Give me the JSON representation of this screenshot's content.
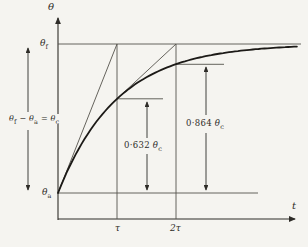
{
  "figure": {
    "bg_color": "#f5f4f0",
    "ink_color": "#2e2c28",
    "thin_line_color": "#55524c"
  },
  "axis": {
    "y_label": "θ",
    "x_label": "t"
  },
  "ticks": {
    "tau": "τ",
    "two_tau": "2τ"
  },
  "levels": {
    "final": {
      "base": "θ",
      "sub": "f"
    },
    "ambient": {
      "base": "θ",
      "sub": "a"
    }
  },
  "annotations": {
    "equation": {
      "t1": "θ",
      "s1": "f",
      "op": "−",
      "t2": "θ",
      "s2": "a",
      "eq": "=",
      "t3": "θ",
      "s3": "c"
    },
    "rise_at_tau": {
      "value": "0·632",
      "theta": "θ",
      "sub": "c"
    },
    "rise_at_two_tau": {
      "value": "0·864",
      "theta": "θ",
      "sub": "c"
    }
  },
  "chart_data": {
    "type": "line",
    "xlabel": "t",
    "ylabel": "θ",
    "x_ticks": [
      "τ",
      "2τ"
    ],
    "y_ticks": [
      "θa",
      "θf"
    ],
    "curve_equation": "θ(t) = θa + θc·(1 − e^(−t/τ)),  θc = θf − θa",
    "x_in_tau_units": [
      0,
      0.25,
      0.5,
      0.75,
      1,
      1.5,
      2,
      2.5,
      3,
      3.5,
      4
    ],
    "rise_fraction_of_theta_c": [
      0,
      0.221,
      0.393,
      0.528,
      0.632,
      0.777,
      0.864,
      0.918,
      0.95,
      0.97,
      0.982
    ],
    "key_points": [
      {
        "t": "τ",
        "rise": "0.632 θc"
      },
      {
        "t": "2τ",
        "rise": "0.864 θc"
      }
    ],
    "tangents": [
      {
        "drawn_from": "origin (t=0, θa)",
        "reaches_final_value_at": "t = τ"
      },
      {
        "drawn_from": "curve point at t=τ",
        "reaches_final_value_at": "t = 2τ"
      }
    ],
    "xlim_tau_units": [
      0,
      4.05
    ],
    "asymptote": "θf",
    "grid": false,
    "legend": "none"
  }
}
